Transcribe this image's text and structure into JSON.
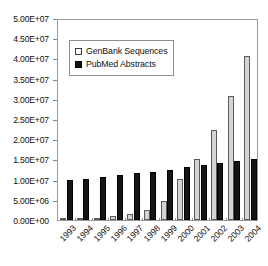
{
  "chart_data": {
    "type": "bar",
    "title": "",
    "xlabel": "",
    "ylabel": "",
    "categories": [
      "1993",
      "1994",
      "1995",
      "1996",
      "1997",
      "1998",
      "1999",
      "2000",
      "2001",
      "2002",
      "2003",
      "2004"
    ],
    "series": [
      {
        "name": "GenBank Sequences",
        "color": "#d4d4d4",
        "values": [
          200000,
          300000,
          600000,
          1000000,
          1600000,
          2600000,
          4600000,
          10100000,
          15000000,
          22300000,
          30800000,
          40500000
        ]
      },
      {
        "name": "PubMed Abstracts",
        "color": "#151515",
        "values": [
          9800000,
          10200000,
          10700000,
          11200000,
          11600000,
          12000000,
          12400000,
          13100000,
          13500000,
          14200000,
          14600000,
          15200000
        ]
      }
    ],
    "ylim": [
      0,
      50000000
    ],
    "ytick_values": [
      0,
      5000000,
      10000000,
      15000000,
      20000000,
      25000000,
      30000000,
      35000000,
      40000000,
      45000000,
      50000000
    ],
    "ytick_labels": [
      "0.00E+00",
      "5.00E+06",
      "1.00E+07",
      "1.50E+07",
      "2.00E+07",
      "2.50E+07",
      "3.00E+07",
      "3.50E+07",
      "4.00E+07",
      "4.50E+07",
      "5.00E+07"
    ],
    "grid": false,
    "legend_position": "upper-left-inside",
    "xtick_rotation": -45
  },
  "legend": {
    "items": [
      {
        "label": "GenBank Sequences",
        "swatch": "light-square-swatch"
      },
      {
        "label": "PubMed Abstracts",
        "swatch": "dark-square-swatch"
      }
    ]
  }
}
